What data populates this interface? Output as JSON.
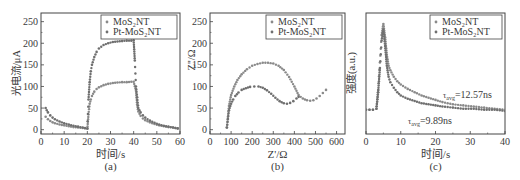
{
  "chart_data": [
    {
      "id": "a",
      "type": "scatter",
      "panel_label": "(a)",
      "title": "",
      "xlabel": "时间/s",
      "ylabel": "光电流/μA",
      "xlim": [
        0,
        60
      ],
      "ylim": [
        -10,
        270
      ],
      "xticks": [
        0,
        10,
        20,
        30,
        40,
        50,
        60
      ],
      "yticks": [
        0,
        50,
        100,
        150,
        200,
        250
      ],
      "grid": false,
      "legend_position": "upper right",
      "legend": [
        "MoS₂NT",
        "Pt-MoS₂NT"
      ],
      "series": [
        {
          "name": "MoS₂NT",
          "color": "#8a8a8a",
          "description": "light on 20-40 s, decays when off",
          "x": [
            2,
            3,
            4,
            5,
            6,
            8,
            10,
            12,
            14,
            16,
            18,
            20,
            20.5,
            21,
            21.5,
            22,
            23,
            24,
            25,
            27,
            29,
            31,
            33,
            35,
            37,
            39,
            40,
            41,
            41.5,
            42,
            43,
            44,
            45,
            47,
            49,
            51,
            53,
            55,
            57,
            59
          ],
          "y": [
            30,
            24,
            20,
            17,
            15,
            12,
            10,
            8,
            6,
            5,
            4,
            2,
            35,
            60,
            70,
            78,
            88,
            94,
            98,
            103,
            106,
            108,
            109,
            110,
            110,
            111,
            111,
            90,
            58,
            42,
            32,
            26,
            22,
            17,
            13,
            10,
            8,
            6,
            5,
            3
          ]
        },
        {
          "name": "Pt-MoS₂NT",
          "color": "#6f6f6f",
          "x": [
            2,
            3,
            4,
            5,
            6,
            8,
            10,
            12,
            14,
            16,
            18,
            20,
            20.5,
            21,
            21.5,
            22,
            23,
            24,
            25,
            27,
            29,
            31,
            33,
            35,
            37,
            39,
            40,
            40.5,
            41,
            41.5,
            42,
            43,
            44,
            45,
            47,
            49,
            51,
            53,
            55,
            57,
            59
          ],
          "y": [
            50,
            40,
            33,
            28,
            24,
            19,
            15,
            12,
            9,
            7,
            5,
            3,
            70,
            110,
            135,
            150,
            168,
            180,
            188,
            196,
            200,
            203,
            204,
            205,
            206,
            206,
            207,
            160,
            100,
            75,
            50,
            40,
            33,
            28,
            21,
            16,
            12,
            9,
            7,
            5,
            3
          ]
        }
      ]
    },
    {
      "id": "b",
      "type": "scatter",
      "panel_label": "(b)",
      "title": "",
      "xlabel": "Z'/Ω",
      "ylabel": "Z''/Ω",
      "xlim": [
        0,
        640
      ],
      "ylim": [
        -10,
        270
      ],
      "xticks": [
        0,
        100,
        200,
        300,
        400,
        500,
        600
      ],
      "yticks": [
        0,
        50,
        100,
        150,
        200,
        250
      ],
      "grid": false,
      "legend_position": "upper right",
      "legend": [
        "MoS₂NT",
        "Pt-MoS₂NT"
      ],
      "series": [
        {
          "name": "MoS₂NT",
          "color": "#8a8a8a",
          "x": [
            80,
            85,
            90,
            100,
            115,
            130,
            150,
            175,
            200,
            225,
            250,
            275,
            300,
            325,
            350,
            375,
            400,
            420,
            440,
            460,
            475,
            490,
            505,
            520,
            535,
            550
          ],
          "y": [
            5,
            30,
            55,
            80,
            100,
            115,
            128,
            140,
            148,
            152,
            155,
            155,
            153,
            148,
            138,
            122,
            100,
            80,
            72,
            68,
            67,
            68,
            72,
            78,
            85,
            92
          ],
          "description": "larger arc (higher impedance)"
        },
        {
          "name": "Pt-MoS₂NT",
          "color": "#6f6f6f",
          "x": [
            80,
            85,
            90,
            100,
            110,
            120,
            135,
            150,
            170,
            190,
            210,
            230,
            250,
            270,
            290,
            310,
            330,
            350,
            365,
            380,
            395,
            410,
            420
          ],
          "y": [
            5,
            25,
            45,
            60,
            70,
            78,
            86,
            92,
            96,
            99,
            100,
            100,
            97,
            91,
            83,
            74,
            66,
            61,
            60,
            62,
            66,
            72,
            76
          ],
          "description": "smaller arc (lower charge-transfer resistance)"
        }
      ]
    },
    {
      "id": "c",
      "type": "scatter",
      "panel_label": "(c)",
      "title": "",
      "xlabel": "时间/s",
      "ylabel": "强度(a.u.)",
      "xlim": [
        0,
        40
      ],
      "ylim": [
        0,
        1.1
      ],
      "xticks": [
        0,
        10,
        20,
        30,
        40
      ],
      "yticks": [],
      "grid": false,
      "legend_position": "upper right",
      "legend": [
        "MoS₂NT",
        "Pt-MoS₂NT"
      ],
      "annotations": [
        {
          "text": "τavg=12.57ns",
          "series": "MoS₂NT"
        },
        {
          "text": "τavg=9.89ns",
          "series": "Pt-MoS₂NT"
        }
      ],
      "series": [
        {
          "name": "MoS₂NT",
          "color": "#8a8a8a",
          "x": [
            0,
            1,
            2,
            3,
            3.5,
            4,
            4.5,
            5,
            5.5,
            6,
            6.5,
            7,
            8,
            9,
            10,
            12,
            14,
            16,
            18,
            20,
            22,
            25,
            28,
            31,
            34,
            37,
            40
          ],
          "y": [
            0.22,
            0.22,
            0.22,
            0.23,
            0.4,
            0.65,
            0.9,
            1.0,
            0.88,
            0.72,
            0.62,
            0.58,
            0.52,
            0.48,
            0.45,
            0.41,
            0.38,
            0.35,
            0.33,
            0.31,
            0.29,
            0.27,
            0.26,
            0.25,
            0.24,
            0.23,
            0.22
          ]
        },
        {
          "name": "Pt-MoS₂NT",
          "color": "#6f6f6f",
          "x": [
            0,
            1,
            2,
            3,
            3.5,
            4,
            4.5,
            5,
            5.5,
            6,
            6.5,
            7,
            8,
            9,
            10,
            12,
            14,
            16,
            18,
            20,
            22,
            25,
            28,
            31,
            34,
            37,
            40
          ],
          "y": [
            0.22,
            0.22,
            0.22,
            0.23,
            0.38,
            0.6,
            0.85,
            0.95,
            0.8,
            0.62,
            0.52,
            0.47,
            0.42,
            0.38,
            0.35,
            0.32,
            0.3,
            0.28,
            0.27,
            0.26,
            0.25,
            0.24,
            0.23,
            0.23,
            0.22,
            0.22,
            0.21
          ]
        }
      ]
    }
  ],
  "panels": {
    "a": {
      "label": "(a)",
      "xlabel": "时间/s",
      "ylabel": "光电流/μA",
      "legend": [
        "MoS₂NT",
        "Pt-MoS₂NT"
      ]
    },
    "b": {
      "label": "(b)",
      "xlabel": "Z'/Ω",
      "ylabel": "Z''/Ω",
      "legend": [
        "MoS₂NT",
        "Pt-MoS₂NT"
      ]
    },
    "c": {
      "label": "(c)",
      "xlabel": "时间/s",
      "ylabel": "强度(a.u.)",
      "legend": [
        "MoS₂NT",
        "Pt-MoS₂NT"
      ],
      "annot1": "=12.57ns",
      "annot2": "=9.89ns",
      "annot_symbol": "τ",
      "annot_sub": "avg"
    }
  },
  "colors": {
    "axis": "#444444",
    "series_light": "#8a8a8a",
    "series_dark": "#6f6f6f"
  }
}
